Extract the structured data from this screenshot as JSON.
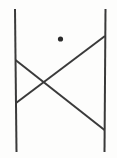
{
  "figure": {
    "background_color": "#fdfdfc",
    "stroke_color": "#3a3a3a",
    "dot_color": "#2b2b2b",
    "canvas": {
      "width": 117,
      "height": 158
    },
    "description": "Two near-vertical lines form the left and right sides; two straight diagonal lines run between them and cross near the middle-left, forming an X shape; a small filled dot sits in the upper middle area.",
    "shapes": [
      {
        "name": "left-vertical-line",
        "kind": "line",
        "x1": 15.0,
        "y1": 9.0,
        "x2": 16.5,
        "y2": 152.0,
        "stroke_width": 2.0,
        "color": "#3a3a3a"
      },
      {
        "name": "right-vertical-line",
        "kind": "line",
        "x1": 105.5,
        "y1": 9.0,
        "x2": 104.5,
        "y2": 152.0,
        "stroke_width": 2.0,
        "color": "#3a3a3a"
      },
      {
        "name": "diagonal-descending",
        "kind": "line",
        "x1": 15.5,
        "y1": 60.0,
        "x2": 104.5,
        "y2": 130.0,
        "stroke_width": 2.0,
        "color": "#3a3a3a"
      },
      {
        "name": "diagonal-ascending",
        "kind": "line",
        "x1": 16.0,
        "y1": 103.0,
        "x2": 105.0,
        "y2": 36.0,
        "stroke_width": 2.0,
        "color": "#3a3a3a"
      },
      {
        "name": "dot-marker",
        "kind": "dot",
        "cx": 60.5,
        "cy": 39.0,
        "r": 2.6,
        "color": "#2b2b2b"
      }
    ],
    "intersection": {
      "name": "diagonal-crossing-point",
      "x": 42.0,
      "y": 82.0
    }
  }
}
